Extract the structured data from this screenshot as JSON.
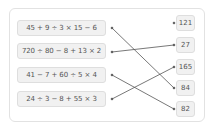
{
  "expressions": [
    {
      "label": "45 + 9 ÷ 3 × 15 − 6"
    },
    {
      "label": "720 ÷ 80 − 8 + 13 × 2"
    },
    {
      "label": "41 − 7 + 60 ÷ 5 × 4"
    },
    {
      "label": "24 ÷ 3 − 8 + 55 × 3"
    }
  ],
  "answers": [
    {
      "label": "121"
    },
    {
      "label": "27"
    },
    {
      "label": "165"
    },
    {
      "label": "84"
    },
    {
      "label": "82"
    }
  ],
  "connections": [
    {
      "from": "45 + 9 ÷ 3 × 15 − 6",
      "to": "84"
    },
    {
      "from": "720 ÷ 80 − 8 + 13 × 2",
      "to": "27"
    },
    {
      "from": "41 − 7 + 60 ÷ 5 × 4",
      "to": "82"
    },
    {
      "from": "24 ÷ 3 − 8 + 55 × 3",
      "to": "165"
    }
  ],
  "colors": {
    "line": "#555555",
    "box_bg": "#f1f1f1",
    "box_border": "#dedede"
  }
}
